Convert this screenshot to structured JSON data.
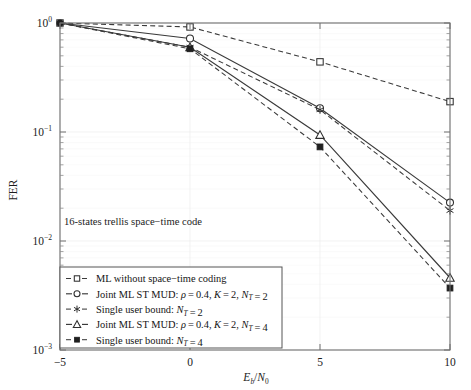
{
  "figure": {
    "annotation": "16-states trellis space−time code",
    "background": "#ffffff",
    "line_color": "#3a3a3a"
  },
  "axes": {
    "x": {
      "label_parts": {
        "e": "E",
        "b": "b",
        "slash": "/",
        "n": "N",
        "zero": "0"
      },
      "label_plain": "Eb/N0",
      "ticks": [
        "−5",
        "0",
        "5",
        "10"
      ],
      "tick_values": [
        -5,
        0,
        5,
        10
      ],
      "range": [
        -5,
        10
      ]
    },
    "y": {
      "label": "FER",
      "ticks": [
        "10 0",
        "10 -1",
        "10 -2",
        "10 -3"
      ],
      "tick_mantissa": "10",
      "tick_exponents": [
        "0",
        "−1",
        "−2",
        "−3"
      ],
      "range": [
        0.001,
        1
      ],
      "scale": "log"
    }
  },
  "legend": {
    "position": "bottom-left-inside",
    "entries": [
      {
        "marker": "square-open",
        "line": "dashed",
        "text_parts": [
          {
            "t": "ML without space−time coding",
            "style": "normal"
          }
        ],
        "text_plain": "ML without space−time coding"
      },
      {
        "marker": "circle-open",
        "line": "solid",
        "text_parts": [
          {
            "t": "Joint ML ST MUD: ",
            "style": "normal"
          },
          {
            "t": "ρ",
            "style": "italic"
          },
          {
            "t": " = 0.4, ",
            "style": "normal"
          },
          {
            "t": "K",
            "style": "italic"
          },
          {
            "t": " = 2, ",
            "style": "normal"
          },
          {
            "t": "N",
            "style": "italic"
          },
          {
            "t": "T",
            "style": "sub-italic"
          },
          {
            "t": " = 2",
            "style": "normal"
          }
        ],
        "text_plain": "Joint ML ST MUD: ρ = 0.4, K = 2, NT = 2"
      },
      {
        "marker": "asterisk",
        "line": "dashed",
        "text_parts": [
          {
            "t": "Single user bound: ",
            "style": "normal"
          },
          {
            "t": "N",
            "style": "italic"
          },
          {
            "t": "T",
            "style": "sub-italic"
          },
          {
            "t": " = 2",
            "style": "normal"
          }
        ],
        "text_plain": "Single user bound: NT = 2"
      },
      {
        "marker": "triangle-open",
        "line": "solid",
        "text_parts": [
          {
            "t": "Joint ML ST MUD: ",
            "style": "normal"
          },
          {
            "t": "ρ",
            "style": "italic"
          },
          {
            "t": " = 0.4, ",
            "style": "normal"
          },
          {
            "t": "K",
            "style": "italic"
          },
          {
            "t": " = 2, ",
            "style": "normal"
          },
          {
            "t": "N",
            "style": "italic"
          },
          {
            "t": "T",
            "style": "sub-italic"
          },
          {
            "t": " = 4",
            "style": "normal"
          }
        ],
        "text_plain": "Joint ML ST MUD: ρ = 0.4, K = 2, NT = 4"
      },
      {
        "marker": "square-filled",
        "line": "dashed",
        "text_parts": [
          {
            "t": "Single user bound: ",
            "style": "normal"
          },
          {
            "t": "N",
            "style": "italic"
          },
          {
            "t": "T",
            "style": "sub-italic"
          },
          {
            "t": " = 4",
            "style": "normal"
          }
        ],
        "text_plain": "Single user bound: NT = 4"
      }
    ]
  },
  "chart_data": {
    "type": "line",
    "title": "",
    "subtitle": "",
    "xlabel": "Eb/N0",
    "ylabel": "FER",
    "xlim": [
      -5,
      10
    ],
    "ylim": [
      0.001,
      1
    ],
    "yscale": "log",
    "grid": true,
    "legend_position": "lower left",
    "annotations": [
      "16-states trellis space−time code"
    ],
    "x": [
      -5,
      0,
      5,
      10
    ],
    "series": [
      {
        "name": "ML without space−time coding",
        "marker": "square-open",
        "linestyle": "dashed",
        "values": [
          1.0,
          0.92,
          0.44,
          0.19
        ]
      },
      {
        "name": "Joint ML ST MUD: ρ = 0.4, K = 2, NT = 2",
        "marker": "circle-open",
        "linestyle": "solid",
        "values": [
          1.0,
          0.72,
          0.165,
          0.0225
        ]
      },
      {
        "name": "Single user bound: NT = 2",
        "marker": "asterisk",
        "linestyle": "dashed",
        "values": [
          1.0,
          0.6,
          0.16,
          0.019
        ]
      },
      {
        "name": "Joint ML ST MUD: ρ = 0.4, K = 2, NT = 4",
        "marker": "triangle-open",
        "linestyle": "solid",
        "values": [
          1.0,
          0.6,
          0.094,
          0.0046
        ]
      },
      {
        "name": "Single user bound: NT = 4",
        "marker": "square-filled",
        "linestyle": "dashed",
        "values": [
          1.0,
          0.58,
          0.073,
          0.0037
        ]
      }
    ]
  }
}
